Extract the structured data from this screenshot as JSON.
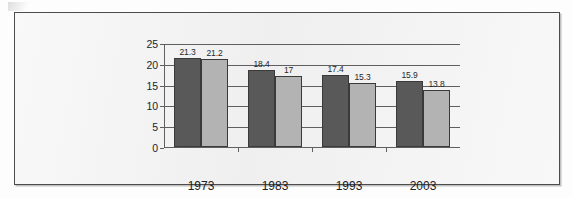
{
  "chart_data": {
    "type": "bar",
    "title": "",
    "subtitle": "",
    "xlabel": "",
    "ylabel": "",
    "categories": [
      "1973",
      "1983",
      "1993",
      "2003"
    ],
    "series": [
      {
        "name": "Public school",
        "color": "#595959",
        "values": [
          21.3,
          18.4,
          17.4,
          15.9
        ]
      },
      {
        "name": "Private school",
        "color": "#b3b3b3",
        "values": [
          21.2,
          17,
          15.3,
          13.8
        ]
      }
    ],
    "value_labels": {
      "public": [
        "21.3",
        "18.4",
        "17.4",
        "15.9"
      ],
      "private": [
        "21.2",
        "17",
        "15.3",
        "13.8"
      ]
    },
    "ylim": [
      0,
      25
    ],
    "yticks": [
      0,
      5,
      10,
      15,
      20,
      25
    ],
    "ytick_labels": [
      "0",
      "5",
      "10",
      "15",
      "20",
      "25"
    ],
    "grid": true,
    "grid_axis": "y",
    "legend_position": "bottom"
  },
  "legend": {
    "items": [
      {
        "label": "Public school",
        "swatch": "public"
      },
      {
        "label": "Private school",
        "swatch": "private"
      }
    ]
  },
  "colors": {
    "public_bar": "#595959",
    "private_bar": "#b3b3b3",
    "bar_outline": "#3a3a3a",
    "axis": "#5f5f5f",
    "frame_border": "#4c4c4c",
    "plot_background": "#f1f1f1",
    "text": "#1d2026"
  }
}
